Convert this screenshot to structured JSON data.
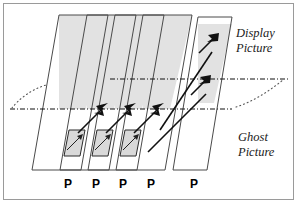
{
  "figure": {
    "type": "optical-ray-diagram",
    "title_labels": {
      "display": "Display\nPicture",
      "display_line1": "Display",
      "display_line2": "Picture",
      "ghost_line1": "Ghost",
      "ghost_line2": "Picture"
    },
    "colors": {
      "plane_fill": "#e2e2e2",
      "plane_stroke": "#4a4a4a",
      "ray": "#111111",
      "ghost_cell_fill": "#d9d9d9",
      "border": "#9a9a9a",
      "background": "#ffffff"
    },
    "planes": [
      {
        "id": "plane-1",
        "label": "P",
        "label_x": 64,
        "label_y": 178
      },
      {
        "id": "plane-2",
        "label": "P",
        "label_x": 92,
        "label_y": 178
      },
      {
        "id": "plane-3",
        "label": "P",
        "label_x": 119,
        "label_y": 178
      },
      {
        "id": "plane-4",
        "label": "P",
        "label_x": 147,
        "label_y": 178
      },
      {
        "id": "plane-5",
        "label": "P",
        "label_x": 190,
        "label_y": 178
      }
    ],
    "region_labels": [
      {
        "id": "display-picture-label",
        "line1": "Display",
        "line2": "Picture",
        "x": 236,
        "y": 26
      },
      {
        "id": "ghost-picture-label",
        "line1": "Ghost",
        "line2": "Picture",
        "x": 236,
        "y": 130
      }
    ],
    "levels": [
      {
        "id": "display-level-line",
        "y": 79
      },
      {
        "id": "ghost-level-line",
        "y": 109
      }
    ],
    "counts": {
      "planes": 5,
      "ghost_cells": 3,
      "mid_arrows": 3,
      "exit_arrows": 2
    }
  }
}
